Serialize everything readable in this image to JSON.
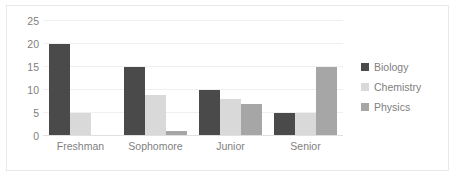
{
  "chart_data": {
    "type": "bar",
    "title": "",
    "xlabel": "",
    "ylabel": "",
    "ylim": [
      0,
      25
    ],
    "yticks": [
      0,
      5,
      10,
      15,
      20,
      25
    ],
    "grid": true,
    "legend_position": "right",
    "categories": [
      "Freshman",
      "Sophomore",
      "Junior",
      "Senior"
    ],
    "series": [
      {
        "name": "Biology",
        "color": "#4a4a4a",
        "values": [
          20,
          15,
          10,
          5
        ]
      },
      {
        "name": "Chemistry",
        "color": "#d9d9d9",
        "values": [
          5,
          9,
          8,
          5
        ]
      },
      {
        "name": "Physics",
        "color": "#a6a6a6",
        "values": [
          0,
          1,
          7,
          15
        ]
      }
    ]
  },
  "axis": {
    "y_tick_labels": [
      "25",
      "20",
      "15",
      "10",
      "5",
      "0"
    ]
  },
  "legend": {
    "items": [
      {
        "label": "Biology"
      },
      {
        "label": "Chemistry"
      },
      {
        "label": "Physics"
      }
    ]
  },
  "colors": {
    "biology": "#4a4a4a",
    "chemistry": "#d9d9d9",
    "physics": "#a6a6a6",
    "gridline": "#efefef",
    "text": "#808080",
    "border": "#e8e8e8",
    "background": "#ffffff"
  }
}
